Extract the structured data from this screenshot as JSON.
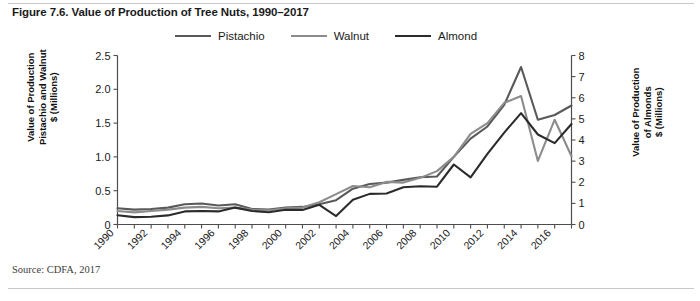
{
  "figure": {
    "title": "Figure 7.6. Value of Production of Tree Nuts, 1990–2017",
    "source_note": "Source: CDFA, 2017"
  },
  "colors": {
    "pistachio": "#595959",
    "walnut": "#8c8c8c",
    "almond": "#2b2b2b",
    "axis": "#4d4d4d",
    "text": "#1a1a1a"
  },
  "legend": {
    "position": "top-center",
    "items": [
      {
        "label": "Pistachio",
        "color": "#595959"
      },
      {
        "label": "Walnut",
        "color": "#8c8c8c"
      },
      {
        "label": "Almond",
        "color": "#2b2b2b"
      }
    ]
  },
  "axes": {
    "y_left": {
      "title": "Value of Production\nPistachio and Walnut\n$ (Millions)",
      "ticks": [
        "0",
        "0.5",
        "1.0",
        "1.5",
        "2.0",
        "2.5"
      ],
      "min": 0,
      "max": 2.5
    },
    "y_right": {
      "title": "Value of Production\nof Almonds\n$ (Millions)",
      "ticks": [
        "0",
        "1",
        "2",
        "3",
        "4",
        "5",
        "6",
        "7",
        "8"
      ],
      "min": 0,
      "max": 8
    },
    "x": {
      "ticks": [
        "1990",
        "1992",
        "1994",
        "1996",
        "1998",
        "2000",
        "2002",
        "2004",
        "2006",
        "2008",
        "2010",
        "2012",
        "2014",
        "2016"
      ],
      "min": 1990,
      "max": 2017
    }
  },
  "chart_data": {
    "type": "line",
    "title": "Figure 7.6. Value of Production of Tree Nuts, 1990–2017",
    "xlabel": "",
    "ylabel": "Value of Production Pistachio and Walnut $ (Millions)",
    "y2label": "Value of Production of Almonds $ (Millions)",
    "grid": false,
    "legend_position": "top-center",
    "xlim": [
      1990,
      2017
    ],
    "ylim": [
      0,
      2.5
    ],
    "y2lim": [
      0,
      8
    ],
    "x": [
      1990,
      1991,
      1992,
      1993,
      1994,
      1995,
      1996,
      1997,
      1998,
      1999,
      2000,
      2001,
      2002,
      2003,
      2004,
      2005,
      2006,
      2007,
      2008,
      2009,
      2010,
      2011,
      2012,
      2013,
      2014,
      2015,
      2016,
      2017
    ],
    "series": [
      {
        "name": "Pistachio",
        "color": "#595959",
        "axis": "left",
        "units": "$ Millions",
        "values": [
          0.24,
          0.22,
          0.23,
          0.25,
          0.3,
          0.31,
          0.28,
          0.3,
          0.23,
          0.22,
          0.25,
          0.26,
          0.3,
          0.36,
          0.53,
          0.6,
          0.62,
          0.66,
          0.7,
          0.71,
          1.0,
          1.27,
          1.45,
          1.77,
          2.33,
          1.55,
          1.62,
          1.76
        ]
      },
      {
        "name": "Walnut",
        "color": "#8c8c8c",
        "axis": "left",
        "units": "$ Millions",
        "values": [
          0.2,
          0.18,
          0.2,
          0.22,
          0.25,
          0.26,
          0.24,
          0.25,
          0.22,
          0.21,
          0.24,
          0.25,
          0.33,
          0.45,
          0.57,
          0.55,
          0.63,
          0.62,
          0.69,
          0.79,
          1.0,
          1.34,
          1.5,
          1.8,
          1.9,
          0.94,
          1.55,
          1.01
        ]
      },
      {
        "name": "Almond",
        "color": "#2b2b2b",
        "axis": "right",
        "units": "$ Millions",
        "values": [
          0.44,
          0.35,
          0.37,
          0.43,
          0.62,
          0.64,
          0.62,
          0.8,
          0.64,
          0.58,
          0.7,
          0.69,
          0.93,
          0.4,
          1.17,
          1.45,
          1.47,
          1.76,
          1.81,
          1.79,
          2.84,
          2.23,
          3.34,
          4.35,
          5.27,
          4.26,
          3.85,
          4.76
        ]
      }
    ]
  }
}
